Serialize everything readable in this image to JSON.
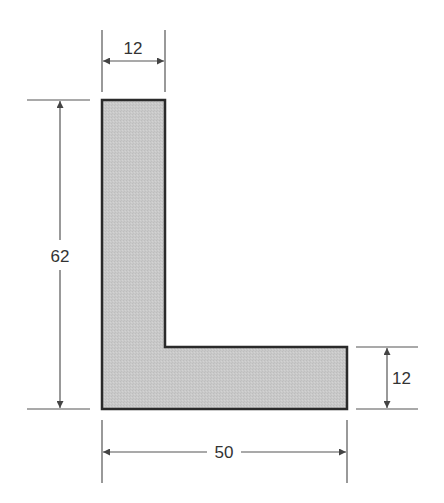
{
  "diagram": {
    "type": "L-shaped cross-section with dimensions",
    "colors": {
      "fill": "#c8c8c8",
      "outline": "#2a2a2a",
      "dimension_line": "#555555",
      "text": "#333333"
    },
    "dimensions": {
      "top_width": "12",
      "height": "62",
      "leg_thickness": "12",
      "base_width": "50"
    }
  }
}
